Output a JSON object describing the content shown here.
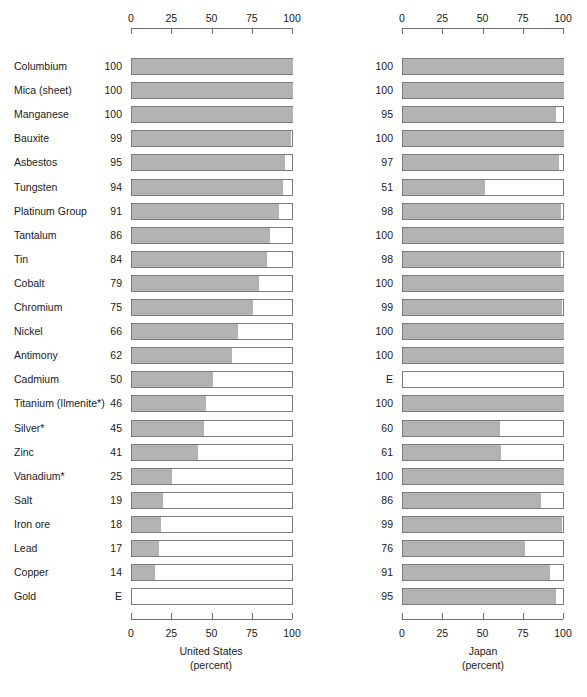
{
  "chart_data": {
    "type": "bar",
    "title": "",
    "orientation": "horizontal",
    "grid": false,
    "legend": null,
    "axis": {
      "ticks": [
        0,
        25,
        50,
        75,
        100
      ],
      "xlim": [
        0,
        100
      ],
      "tick_labels": [
        "0",
        "25",
        "50",
        "75",
        "100"
      ],
      "top_axis": true,
      "bottom_axis": true
    },
    "categories": [
      "Columbium",
      "Mica (sheet)",
      "Manganese",
      "Bauxite",
      "Asbestos",
      "Tungsten",
      "Platinum Group",
      "Tantalum",
      "Tin",
      "Cobalt",
      "Chromium",
      "Nickel",
      "Antimony",
      "Cadmium",
      "Titanium (Ilmenite*)",
      "Silver*",
      "Zinc",
      "Vanadium*",
      "Salt",
      "Iron ore",
      "Lead",
      "Copper",
      "Gold"
    ],
    "series": [
      {
        "name": "United States",
        "xlabel": "United States",
        "units": "(percent)",
        "value_labels": [
          "100",
          "100",
          "100",
          "99",
          "95",
          "94",
          "91",
          "86",
          "84",
          "79",
          "75",
          "66",
          "62",
          "50",
          "46",
          "45",
          "41",
          "25",
          "19",
          "18",
          "17",
          "14",
          "E"
        ],
        "values": [
          100,
          100,
          100,
          99,
          95,
          94,
          91,
          86,
          84,
          79,
          75,
          66,
          62,
          50,
          46,
          45,
          41,
          25,
          19,
          18,
          17,
          14,
          0
        ]
      },
      {
        "name": "Japan",
        "xlabel": "Japan",
        "units": "(percent)",
        "value_labels": [
          "100",
          "100",
          "95",
          "100",
          "97",
          "51",
          "98",
          "100",
          "98",
          "100",
          "99",
          "100",
          "100",
          "E",
          "100",
          "60",
          "61",
          "100",
          "86",
          "99",
          "76",
          "91",
          "95"
        ],
        "values": [
          100,
          100,
          95,
          100,
          97,
          51,
          98,
          100,
          98,
          100,
          99,
          100,
          100,
          0,
          100,
          60,
          61,
          100,
          86,
          99,
          76,
          91,
          95
        ]
      }
    ],
    "colors": {
      "bar_fill": "#b3b3b3",
      "bar_border": "#7b7b7b",
      "axis": "#6e6e6e",
      "text": "#1a1a1a",
      "background": "#ffffff"
    },
    "notes": {
      "estimate_marker": "E"
    }
  }
}
